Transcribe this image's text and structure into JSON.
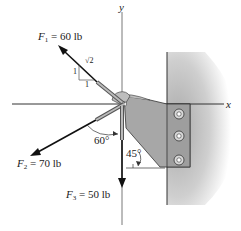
{
  "diagram": {
    "axes": {
      "x_label": "x",
      "y_label": "y"
    },
    "forces": [
      {
        "symbol": "F",
        "subscript": "1",
        "equals": " = ",
        "value": "60 lb"
      },
      {
        "symbol": "F",
        "subscript": "2",
        "equals": " = ",
        "value": "70 lb"
      },
      {
        "symbol": "F",
        "subscript": "3",
        "equals": " = ",
        "value": "50 lb"
      }
    ],
    "slope_triangle": {
      "rise": "1",
      "run": "1",
      "hyp": "√2"
    },
    "angles": {
      "f2_angle": "60°",
      "bracket_angle": "45°"
    },
    "colors": {
      "ink": "#1a1a1a",
      "wall": "#b0b0b0",
      "plate": "#a8a8a8",
      "background": "#ffffff"
    }
  }
}
